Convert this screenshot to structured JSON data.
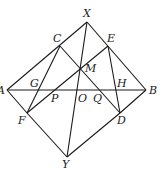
{
  "diagram": {
    "points": {
      "X": {
        "label": "X",
        "x": 87,
        "y": 22,
        "lx": 83,
        "ly": 17
      },
      "C": {
        "label": "C",
        "x": 60,
        "y": 46,
        "lx": 53,
        "ly": 42
      },
      "E": {
        "label": "E",
        "x": 108,
        "y": 46,
        "lx": 107,
        "ly": 42
      },
      "M": {
        "label": "M",
        "x": 80,
        "y": 68,
        "lx": 85,
        "ly": 72
      },
      "A": {
        "label": "A",
        "x": 7,
        "y": 90,
        "lx": -3,
        "ly": 94
      },
      "B": {
        "label": "B",
        "x": 146,
        "y": 90,
        "lx": 149,
        "ly": 94
      },
      "G": {
        "label": "G",
        "x": 38,
        "y": 90,
        "lx": 30,
        "ly": 87
      },
      "P": {
        "label": "P",
        "x": 51,
        "y": 90,
        "lx": 51,
        "ly": 102
      },
      "O": {
        "label": "O",
        "x": 78,
        "y": 90,
        "lx": 78,
        "ly": 102
      },
      "Q": {
        "label": "Q",
        "x": 94,
        "y": 90,
        "lx": 93,
        "ly": 102
      },
      "H": {
        "label": "H",
        "x": 116,
        "y": 90,
        "lx": 117,
        "ly": 87
      },
      "F": {
        "label": "F",
        "x": 27,
        "y": 113,
        "lx": 18,
        "ly": 124
      },
      "D": {
        "label": "D",
        "x": 120,
        "y": 113,
        "lx": 117,
        "ly": 124
      },
      "Y": {
        "label": "Y",
        "x": 67,
        "y": 157,
        "lx": 62,
        "ly": 168
      }
    },
    "segments": [
      [
        "A",
        "X"
      ],
      [
        "X",
        "B"
      ],
      [
        "A",
        "F"
      ],
      [
        "F",
        "Y"
      ],
      [
        "Y",
        "D"
      ],
      [
        "D",
        "B"
      ],
      [
        "A",
        "B"
      ],
      [
        "X",
        "Y"
      ],
      [
        "C",
        "F"
      ],
      [
        "C",
        "D"
      ],
      [
        "E",
        "F"
      ],
      [
        "E",
        "D"
      ]
    ]
  }
}
